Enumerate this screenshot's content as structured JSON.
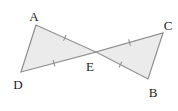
{
  "diagram": {
    "background": "#ffffff",
    "fill_color": "#ebebeb",
    "stroke_color": "#8f8f8f",
    "tick_color": "#8f8f8f",
    "label_color": "#1c1c1c",
    "points": {
      "A": {
        "x": 36,
        "y": 25
      },
      "D": {
        "x": 21,
        "y": 72
      },
      "E": {
        "x": 96,
        "y": 52
      },
      "C": {
        "x": 163,
        "y": 33
      },
      "B": {
        "x": 148,
        "y": 79
      }
    },
    "triangles": [
      {
        "vertices": [
          "A",
          "D",
          "E"
        ]
      },
      {
        "vertices": [
          "C",
          "B",
          "E"
        ]
      }
    ],
    "tick_marks": [
      {
        "from": "A",
        "to": "E",
        "t": 0.48,
        "count": 1
      },
      {
        "from": "D",
        "to": "E",
        "t": 0.44,
        "count": 1
      },
      {
        "from": "E",
        "to": "C",
        "t": 0.5,
        "count": 1
      },
      {
        "from": "E",
        "to": "B",
        "t": 0.47,
        "count": 1
      }
    ],
    "labels": [
      {
        "text": "A",
        "x": 34,
        "y": 16
      },
      {
        "text": "D",
        "x": 18,
        "y": 84
      },
      {
        "text": "E",
        "x": 90,
        "y": 66
      },
      {
        "text": "C",
        "x": 168,
        "y": 25
      },
      {
        "text": "B",
        "x": 153,
        "y": 92
      }
    ]
  }
}
